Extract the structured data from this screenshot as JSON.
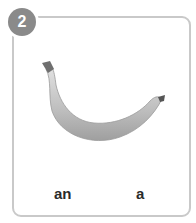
{
  "card": {
    "number": "2",
    "image": "banana",
    "options": [
      {
        "label": "an"
      },
      {
        "label": "a"
      }
    ]
  },
  "colors": {
    "badge": "#8a8a8a",
    "border": "#c9c9c9",
    "text": "#2a2a2a"
  }
}
